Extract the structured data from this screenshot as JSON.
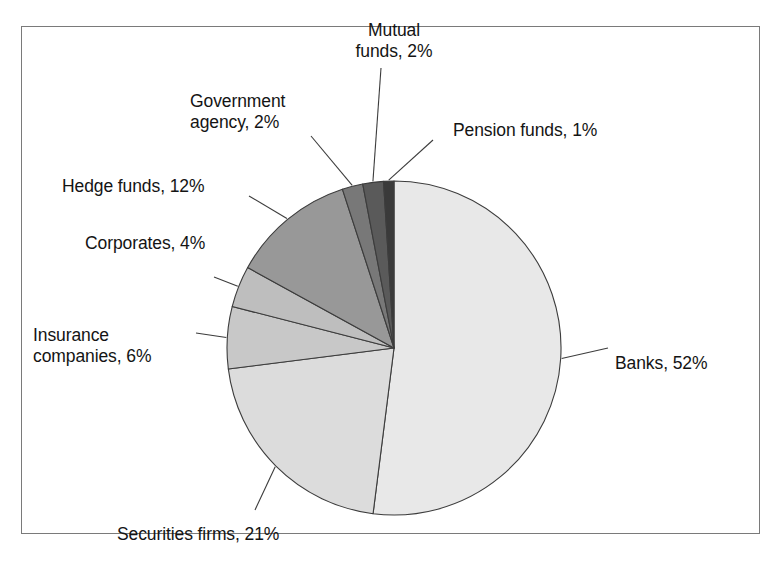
{
  "figure": {
    "frame": {
      "border_color": "#7a7a7a",
      "background": "#ffffff"
    },
    "pie": {
      "center_x": 394,
      "center_y": 348,
      "radius": 167,
      "start_angle_deg": 0,
      "direction": "clockwise",
      "outline_color": "#3c3c3c"
    }
  },
  "chart_data": {
    "type": "pie",
    "title": "",
    "subtitle": "",
    "xlabel": "",
    "ylabel": "",
    "grid": false,
    "legend_position": "none",
    "label_format": "{name}, {value}%",
    "total_percent": 100,
    "categories": [
      "Banks",
      "Securities firms",
      "Insurance companies",
      "Corporates",
      "Hedge funds",
      "Government agency",
      "Mutual funds",
      "Pension funds"
    ],
    "values": [
      52,
      21,
      6,
      4,
      12,
      2,
      2,
      1
    ],
    "slices": [
      {
        "name": "Banks",
        "value": 52,
        "label": "Banks, 52%",
        "color": "#e8e8e8",
        "label_position": "right",
        "label_x": 615,
        "label_y": 353,
        "label_align": "label-right"
      },
      {
        "name": "Securities firms",
        "value": 21,
        "label": "Securities firms, 21%",
        "color": "#dcdcdc",
        "label_position": "bottom-left",
        "label_x": 117,
        "label_y": 524,
        "label_align": "label-right"
      },
      {
        "name": "Insurance companies",
        "value": 6,
        "label": "Insurance\ncompanies, 6%",
        "label_line_1": "Insurance",
        "label_line_2": "companies, 6%",
        "color": "#c8c8c8",
        "label_position": "left",
        "label_x": 33,
        "label_y": 325,
        "label_align": "label-right"
      },
      {
        "name": "Corporates",
        "value": 4,
        "label": "Corporates, 4%",
        "color": "#bebebe",
        "label_position": "left",
        "label_x": 85,
        "label_y": 233,
        "label_align": "label-right"
      },
      {
        "name": "Hedge funds",
        "value": 12,
        "label": "Hedge funds, 12%",
        "color": "#989898",
        "label_position": "left",
        "label_x": 62,
        "label_y": 176,
        "label_align": "label-right"
      },
      {
        "name": "Government agency",
        "value": 2,
        "label": "Government\nagency, 2%",
        "label_line_1": "Government",
        "label_line_2": "agency, 2%",
        "color": "#787878",
        "label_position": "top-left",
        "label_x": 190,
        "label_y": 91,
        "label_align": "label-right"
      },
      {
        "name": "Mutual funds",
        "value": 2,
        "label": "Mutual\nfunds, 2%",
        "label_line_1": "Mutual",
        "label_line_2": "funds, 2%",
        "color": "#5a5a5a",
        "label_position": "top",
        "label_x": 334,
        "label_y": 20,
        "label_align": "label-center"
      },
      {
        "name": "Pension funds",
        "value": 1,
        "label": "Pension funds, 1%",
        "color": "#3a3a3a",
        "label_position": "top-right",
        "label_x": 453,
        "label_y": 120,
        "label_align": "label-right"
      }
    ]
  }
}
